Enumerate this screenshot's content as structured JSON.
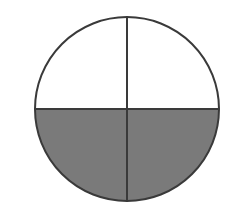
{
  "diagram": {
    "type": "fraction-circle",
    "total_parts": 4,
    "shaded_parts": 2,
    "colors": {
      "shaded": "#7a7a7a",
      "unshaded": "#ffffff",
      "stroke": "#3a3a3a"
    }
  }
}
